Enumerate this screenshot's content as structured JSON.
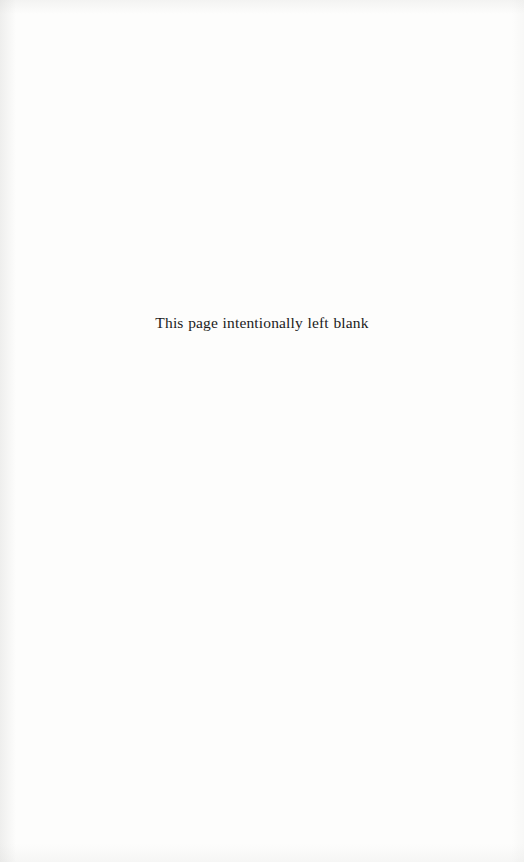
{
  "page": {
    "kind": "scanned-book-page",
    "width": 524,
    "height": 862,
    "background_color": "#fdfdfc",
    "text_color": "#1b1b1b"
  },
  "content": {
    "notice": "This page intentionally left blank"
  }
}
